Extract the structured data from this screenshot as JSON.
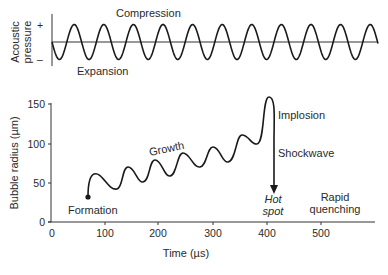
{
  "top_panel": {
    "ylabel_line1": "Acoustic",
    "ylabel_line2": "pressure",
    "plus_label": "+",
    "minus_label": "–",
    "compression_label": "Compression",
    "expansion_label": "Expansion"
  },
  "bottom_panel": {
    "ylabel": "Bubble radius (µm)",
    "xlabel": "Time (µs)",
    "y_ticks": [
      "0",
      "50",
      "100",
      "150"
    ],
    "x_ticks": [
      "0",
      "100",
      "200",
      "300",
      "400",
      "500"
    ],
    "annotations": {
      "formation": "Formation",
      "growth": "Growth",
      "implosion": "Implosion",
      "shockwave": "Shockwave",
      "hot_spot_line1": "Hot",
      "hot_spot_line2": "spot",
      "rapid_line1": "Rapid",
      "rapid_line2": "quenching"
    }
  },
  "chart_data": {
    "type": "line",
    "title": "",
    "xlabel": "Time (µs)",
    "ylabel": "Bubble radius (µm)",
    "xlim": [
      0,
      600
    ],
    "ylim": [
      0,
      150
    ],
    "x": [
      68,
      80,
      122,
      143,
      171,
      192,
      221,
      245,
      277,
      300,
      328,
      355,
      383,
      407,
      414
    ],
    "values": [
      32,
      61,
      42,
      70,
      51,
      79,
      59,
      88,
      70,
      95,
      76,
      111,
      99,
      158,
      38
    ],
    "series_name": "Bubble radius"
  }
}
